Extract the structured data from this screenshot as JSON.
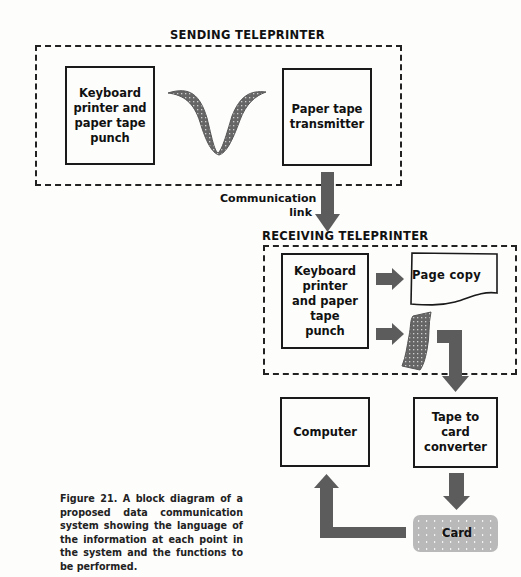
{
  "sending": {
    "title": "SENDING TELEPRINTER",
    "left_box": "Keyboard printer and paper tape punch",
    "right_box": "Paper tape transmitter"
  },
  "link_label": [
    "Communication",
    "link"
  ],
  "receiving": {
    "title": "RECEIVING TELEPRINTER",
    "left_box": "Keyboard printer and paper tape punch",
    "page_copy": "Page copy"
  },
  "computer_box": "Computer",
  "converter_box": "Tape to card converter",
  "card_label": "Card",
  "caption": "Figure 21.  A block diagram of a proposed data communication system showing the language of the information at each point in the system and the functions to be performed.",
  "colors": {
    "arrow": "#5c5c5c",
    "tape": "#6a6a6a",
    "card": "#b9b9b9"
  }
}
